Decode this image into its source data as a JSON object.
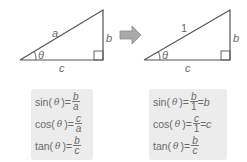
{
  "colors": {
    "line": "#555555",
    "text": "#6a6a6a",
    "box_bg": "#ececec",
    "arrow_fill": "#a9a9a9",
    "arrow_stroke": "#8c8c8c"
  },
  "left_triangle": {
    "hypotenuse_label": "a",
    "vertical_label": "b",
    "base_label": "c",
    "angle_label": "θ"
  },
  "right_triangle": {
    "hypotenuse_label": "1",
    "vertical_label": "b",
    "base_label": "c",
    "angle_label": "θ"
  },
  "arrow": {
    "icon": "right-arrow-icon"
  },
  "left_box": {
    "rows": [
      {
        "fn": "sin(",
        "theta": "θ",
        "close": ")=",
        "num": "b",
        "den": "a"
      },
      {
        "fn": "cos(",
        "theta": "θ",
        "close": ")=",
        "num": "c",
        "den": "a"
      },
      {
        "fn": "tan(",
        "theta": "θ",
        "close": ")=",
        "num": "b",
        "den": "c"
      }
    ]
  },
  "right_box": {
    "rows": [
      {
        "fn": "sin(",
        "theta": "θ",
        "close": ")=",
        "num": "b",
        "den": "1",
        "tail": "=b"
      },
      {
        "fn": "cos(",
        "theta": "θ",
        "close": ")=",
        "num": "c",
        "den": "1",
        "tail": "=c"
      },
      {
        "fn": "tan(",
        "theta": "θ",
        "close": ")=",
        "num": "b",
        "den": "c"
      }
    ]
  }
}
